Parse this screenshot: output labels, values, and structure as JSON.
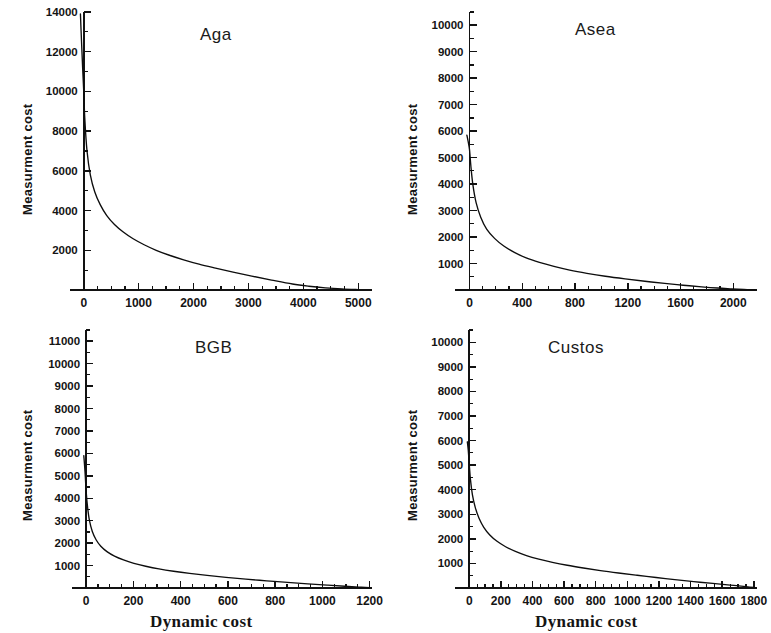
{
  "figure": {
    "width": 771,
    "height": 633,
    "background": "#ffffff",
    "line_color": "#0d0d0d",
    "axis_color": "#121212",
    "text_color": "#141414",
    "shared_xlabel": "Dynamic cost",
    "shared_ylabel": "Measurment cost"
  },
  "chart_data": [
    {
      "type": "line",
      "title": "Aga",
      "xlabel": "",
      "ylabel": "Measurment cost",
      "xlim": [
        -250,
        5250
      ],
      "ylim": [
        0,
        14000
      ],
      "xticks": [
        0,
        1000,
        2000,
        3000,
        4000,
        5000
      ],
      "xtick_labels": [
        "0",
        "1000",
        "2000",
        "3000",
        "4000",
        "5000"
      ],
      "x_minor_step": 250,
      "yticks": [
        2000,
        4000,
        6000,
        8000,
        10000,
        12000,
        14000
      ],
      "ytick_labels": [
        "2000",
        "4000",
        "6000",
        "8000",
        "10000",
        "12000",
        "14000"
      ],
      "y_minor_step": 1000,
      "grid": false,
      "legend": "none",
      "x": [
        -60,
        -40,
        -20,
        0,
        20,
        60,
        120,
        200,
        300,
        420,
        560,
        720,
        900,
        1100,
        1320,
        1560,
        1820,
        2100,
        2400,
        2720,
        3060,
        3420,
        3800,
        4100,
        4400,
        4700,
        5000
      ],
      "y": [
        13900,
        12500,
        11200,
        10000,
        8600,
        7000,
        5800,
        4950,
        4300,
        3750,
        3300,
        2920,
        2580,
        2280,
        2000,
        1750,
        1520,
        1300,
        1100,
        900,
        700,
        500,
        300,
        190,
        110,
        55,
        20
      ]
    },
    {
      "type": "line",
      "title": "Asea",
      "xlabel": "",
      "ylabel": "Measurment cost",
      "xlim": [
        -110,
        2180
      ],
      "ylim": [
        0,
        10500
      ],
      "xticks": [
        0,
        400,
        800,
        1200,
        1600,
        2000
      ],
      "xtick_labels": [
        "0",
        "400",
        "800",
        "1200",
        "1600",
        "2000"
      ],
      "x_minor_step": 100,
      "yticks": [
        1000,
        2000,
        3000,
        4000,
        5000,
        6000,
        7000,
        8000,
        9000,
        10000
      ],
      "ytick_labels": [
        "1000",
        "2000",
        "3000",
        "4000",
        "5000",
        "6000",
        "7000",
        "8000",
        "9000",
        "10000"
      ],
      "y_minor_step": 500,
      "grid": false,
      "legend": "none",
      "x": [
        -20,
        -10,
        0,
        10,
        25,
        50,
        85,
        130,
        190,
        260,
        340,
        430,
        530,
        640,
        760,
        890,
        1030,
        1180,
        1330,
        1480,
        1620,
        1760,
        1880,
        1990,
        2080,
        2160
      ],
      "y": [
        5850,
        5600,
        5300,
        4700,
        4000,
        3300,
        2750,
        2300,
        1950,
        1660,
        1420,
        1210,
        1040,
        890,
        750,
        630,
        520,
        420,
        330,
        250,
        180,
        120,
        75,
        45,
        22,
        8
      ]
    },
    {
      "type": "line",
      "title": "BGB",
      "xlabel": "Dynamic cost",
      "ylabel": "Measurment cost",
      "xlim": [
        -60,
        1210
      ],
      "ylim": [
        0,
        11500
      ],
      "xticks": [
        0,
        200,
        400,
        600,
        800,
        1000,
        1200
      ],
      "xtick_labels": [
        "0",
        "200",
        "400",
        "600",
        "800",
        "1000",
        "1200"
      ],
      "x_minor_step": 50,
      "yticks": [
        1000,
        2000,
        3000,
        4000,
        5000,
        6000,
        7000,
        8000,
        9000,
        10000,
        11000
      ],
      "ytick_labels": [
        "1000",
        "2000",
        "3000",
        "4000",
        "5000",
        "6000",
        "7000",
        "8000",
        "9000",
        "10000",
        "11000"
      ],
      "y_minor_step": 500,
      "grid": false,
      "legend": "none",
      "x": [
        -10,
        -5,
        0,
        6,
        14,
        26,
        42,
        62,
        88,
        120,
        158,
        202,
        252,
        308,
        370,
        438,
        512,
        592,
        676,
        764,
        852,
        938,
        1020,
        1095,
        1155,
        1200
      ],
      "y": [
        5900,
        5200,
        4300,
        3600,
        3000,
        2520,
        2150,
        1860,
        1620,
        1420,
        1250,
        1100,
        970,
        850,
        745,
        650,
        560,
        475,
        395,
        320,
        250,
        185,
        128,
        80,
        42,
        15
      ]
    },
    {
      "type": "line",
      "title": "Custos",
      "xlabel": "Dynamic cost",
      "ylabel": "Measurment cost",
      "xlim": [
        -90,
        1820
      ],
      "ylim": [
        0,
        10500
      ],
      "xticks": [
        0,
        200,
        400,
        600,
        800,
        1000,
        1200,
        1400,
        1600,
        1800
      ],
      "xtick_labels": [
        "0",
        "200",
        "400",
        "600",
        "800",
        "1000",
        "1200",
        "1400",
        "1600",
        "1800"
      ],
      "x_minor_step": 50,
      "yticks": [
        1000,
        2000,
        3000,
        4000,
        5000,
        6000,
        7000,
        8000,
        9000,
        10000
      ],
      "ytick_labels": [
        "1000",
        "2000",
        "3000",
        "4000",
        "5000",
        "6000",
        "7000",
        "8000",
        "9000",
        "10000"
      ],
      "y_minor_step": 500,
      "grid": false,
      "legend": "none",
      "x": [
        -12,
        -6,
        0,
        8,
        20,
        38,
        62,
        92,
        130,
        176,
        230,
        292,
        362,
        440,
        526,
        620,
        722,
        830,
        944,
        1062,
        1182,
        1300,
        1420,
        1540,
        1650,
        1750,
        1810
      ],
      "y": [
        5950,
        5600,
        5050,
        4400,
        3800,
        3280,
        2840,
        2470,
        2160,
        1900,
        1680,
        1490,
        1320,
        1175,
        1045,
        925,
        815,
        710,
        612,
        518,
        428,
        342,
        260,
        185,
        118,
        58,
        18
      ]
    }
  ]
}
